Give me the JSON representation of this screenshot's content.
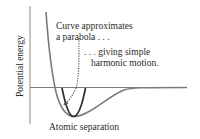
{
  "diagram": {
    "y_axis_label": "Potential energy",
    "x_axis_label": "Atomic separation",
    "annotation_1": {
      "line1": "Curve approximates",
      "line2": "a parabola . . ."
    },
    "annotation_2": {
      "line1": ". . . giving simple",
      "line2": "harmonic motion."
    },
    "elements": [
      {
        "name": "potential-energy-curve",
        "color": "#7a7a7a"
      },
      {
        "name": "approximating-parabola",
        "color": "#2b2b2b"
      },
      {
        "name": "dotted-arrow",
        "color": "#555555"
      },
      {
        "name": "zero-energy-axis",
        "color": "#7a7a7a"
      },
      {
        "name": "vertical-axis",
        "color": "#8a8a8a"
      }
    ]
  }
}
